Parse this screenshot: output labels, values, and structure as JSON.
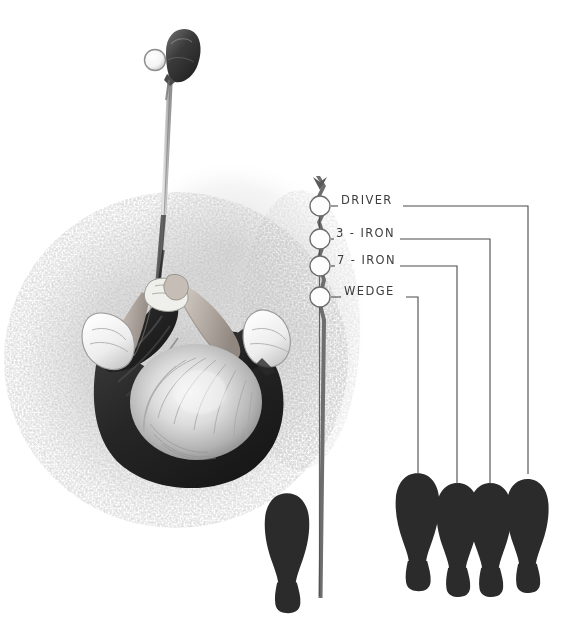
{
  "illustration": {
    "title": "Golf stance width guide",
    "subject": "overhead-view-golfer-address-position",
    "background_color": "#ffffff",
    "ink_color": "#3d3d3d",
    "footprint_color": "#2b2b2b",
    "shoe_highlight_color": "#f2f2f2",
    "shirt_color": "#2e2e2e",
    "hair_color": "#d8d8d8",
    "halo_color": "#d9d9d9"
  },
  "target_line": {
    "name": "target-line",
    "x": 320,
    "top": 176,
    "bottom": 598,
    "color": "#6b6b6b"
  },
  "ball_markers": [
    {
      "label": "ball-marker-driver",
      "cx": 320,
      "cy": 206,
      "r": 10
    },
    {
      "label": "ball-marker-3-iron",
      "cx": 320,
      "cy": 239,
      "r": 10
    },
    {
      "label": "ball-marker-7-iron",
      "cx": 320,
      "cy": 266,
      "r": 10
    },
    {
      "label": "ball-marker-wedge",
      "cx": 320,
      "cy": 297,
      "r": 10
    }
  ],
  "club_labels": [
    {
      "id": "driver",
      "text": "DRIVER",
      "text_x": 341,
      "text_y": 201,
      "tick_x1": 331,
      "tick_x2": 338,
      "lead_x1": 403,
      "lead_x2": 528,
      "drop_y": 472
    },
    {
      "id": "3-iron",
      "text": "3 - IRON",
      "text_x": 336,
      "text_y": 234,
      "tick_x1": 331,
      "tick_x2": 334,
      "lead_x1": 400,
      "lead_x2": 490,
      "drop_y": 482
    },
    {
      "id": "7-iron",
      "text": "7 - IRON",
      "text_x": 337,
      "text_y": 261,
      "tick_x1": 331,
      "tick_x2": 335,
      "lead_x1": 400,
      "lead_x2": 457,
      "drop_y": 482
    },
    {
      "id": "wedge",
      "text": "WEDGE",
      "text_x": 344,
      "text_y": 292,
      "tick_x1": 331,
      "tick_x2": 341,
      "lead_x1": 406,
      "lead_x2": 418,
      "drop_y": 478
    }
  ],
  "stance_footprints": [
    {
      "id": "footprint-wedge",
      "cx": 418,
      "top": 472,
      "scale": 1.0
    },
    {
      "id": "footprint-7-iron",
      "cx": 457,
      "top": 482,
      "scale": 0.96
    },
    {
      "id": "footprint-3-iron",
      "cx": 490,
      "top": 482,
      "scale": 0.96
    },
    {
      "id": "footprint-driver",
      "cx": 528,
      "top": 478,
      "scale": 0.96
    }
  ],
  "reference_footprint": {
    "id": "footprint-reference-left-foot",
    "cx": 287,
    "top": 492,
    "scale": 1.0
  },
  "golfer": {
    "club_head": {
      "cx": 178,
      "cy": 55,
      "ball_cx": 155,
      "ball_cy": 60,
      "ball_r": 10
    },
    "shaft": {
      "x1": 172,
      "y1": 80,
      "x2": 162,
      "y2": 282
    },
    "description": "overhead view of golfer at address gripping club"
  }
}
